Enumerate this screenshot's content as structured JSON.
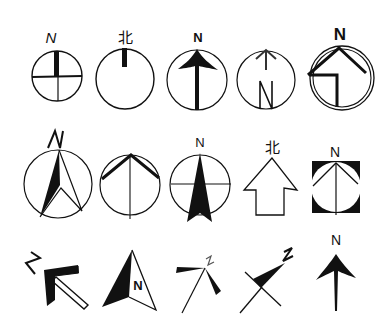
{
  "colors": {
    "ink": "#111111",
    "background": "#ffffff"
  },
  "symbols": [
    {
      "id": 1,
      "row": 1,
      "label": "N",
      "style": "circle-crosshair-thick-north-bar"
    },
    {
      "id": 2,
      "row": 1,
      "label": "北",
      "style": "circle-thick-north-tick"
    },
    {
      "id": 3,
      "row": 1,
      "label": "N",
      "style": "circle-filled-arrowhead-full-shaft"
    },
    {
      "id": 4,
      "row": 1,
      "label": "N",
      "style": "circle-small-arrow-with-N-inside"
    },
    {
      "id": 5,
      "row": 1,
      "label": "N",
      "style": "double-circle-house-chevron"
    },
    {
      "id": 6,
      "row": 2,
      "label": "N",
      "style": "circle-half-filled-needle"
    },
    {
      "id": 7,
      "row": 2,
      "label": "",
      "style": "circle-chevron-vertical-line"
    },
    {
      "id": 8,
      "row": 2,
      "label": "N",
      "style": "circle-filled-dart-crosshair"
    },
    {
      "id": 9,
      "row": 2,
      "label": "北",
      "style": "outline-block-arrow"
    },
    {
      "id": 10,
      "row": 2,
      "label": "N",
      "style": "black-square-circle-chevron"
    },
    {
      "id": 11,
      "row": 3,
      "label": "N",
      "style": "diagonal-outlined-arrow-tilted-N"
    },
    {
      "id": 12,
      "row": 3,
      "label": "N",
      "style": "half-filled-triangle-N-inside"
    },
    {
      "id": 13,
      "row": 3,
      "label": "N",
      "style": "pinwheel-blades-diagonal-line"
    },
    {
      "id": 14,
      "row": 3,
      "label": "N",
      "style": "filled-pennant-cross-diagonal"
    },
    {
      "id": 15,
      "row": 3,
      "label": "N",
      "style": "filled-arrow-plain"
    }
  ]
}
